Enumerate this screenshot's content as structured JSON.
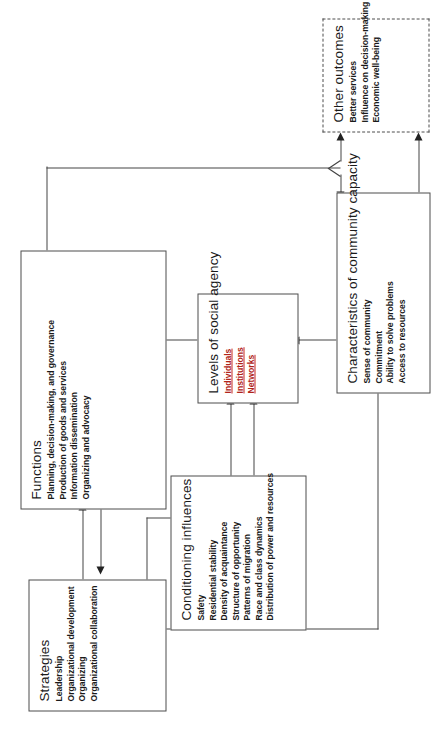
{
  "diagram": {
    "orientation": "rotated-90-ccw",
    "boxes": {
      "conditioning_influences": {
        "title": "Conditioning influences",
        "items": [
          "Safety",
          "Residential stability",
          "Density of acquaintance",
          "Structure of opportunity",
          "Patterns of migration",
          "Race and class dynamics",
          "Distribution of power and resources"
        ]
      },
      "strategies": {
        "title": "Strategies",
        "items": [
          "Leadership",
          "Organizational development",
          "Organizing",
          "Organizational collaboration"
        ]
      },
      "levels_of_social_agency": {
        "title": "Levels of social agency",
        "items": [
          "Individuals",
          "Institutions",
          "Networks"
        ]
      },
      "functions": {
        "title": "Functions",
        "items": [
          "Planning, decision-making, and governance",
          "Production of goods and services",
          "Information dissemination",
          "Organizing and advocacy"
        ]
      },
      "characteristics_of_community_capacity": {
        "title": "Characteristics of community capacity",
        "items": [
          "Sense of community",
          "Commitment",
          "Ability to solve problems",
          "Access to resources"
        ]
      },
      "other_outcomes": {
        "title": "Other outcomes",
        "items": [
          "Better services",
          "Influence on decision-making",
          "Economic well-being"
        ]
      }
    },
    "colors": {
      "box_stroke": "#4d4d4d",
      "connector": "#444444",
      "text": "#1a1a1a",
      "spellcheck_underline": "#cc2a1d",
      "background": "#ffffff"
    }
  }
}
